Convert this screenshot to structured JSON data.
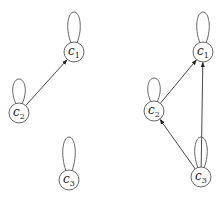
{
  "graphs": [
    {
      "name": "left-graph",
      "nodes": [
        {
          "id": "c1",
          "base": "c",
          "sub": "1",
          "x": 74,
          "y": 52,
          "loop_top": 12
        },
        {
          "id": "c2",
          "base": "c",
          "sub": "2",
          "x": 19,
          "y": 113,
          "loop_top": 79
        },
        {
          "id": "c3",
          "base": "c",
          "sub": "3",
          "x": 69,
          "y": 180,
          "loop_top": 137
        }
      ],
      "edges": [
        {
          "from": "c2",
          "to": "c1"
        }
      ]
    },
    {
      "name": "right-graph",
      "nodes": [
        {
          "id": "c1",
          "base": "c",
          "sub": "1",
          "x": 203,
          "y": 52,
          "loop_top": 12
        },
        {
          "id": "c2",
          "base": "c",
          "sub": "2",
          "x": 154,
          "y": 111,
          "loop_top": 78
        },
        {
          "id": "c3",
          "base": "c",
          "sub": "3",
          "x": 201,
          "y": 177,
          "loop_top": 137
        }
      ],
      "edges": [
        {
          "from": "c2",
          "to": "c1"
        },
        {
          "from": "c3",
          "to": "c1"
        },
        {
          "from": "c3",
          "to": "c2"
        }
      ]
    }
  ],
  "colors": {
    "stroke": "#555555",
    "edge": "#333333",
    "text": "#222222"
  }
}
